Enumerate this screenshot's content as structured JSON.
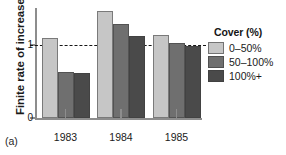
{
  "panel_label": "(a)",
  "axes": {
    "ylabel": "Finite rate of increase",
    "yticks": [
      {
        "value": 0,
        "label": "0"
      },
      {
        "value": 1,
        "label": "1"
      }
    ],
    "xticks": [
      "1983",
      "1984",
      "1985"
    ]
  },
  "legend": {
    "title": "Cover (%)",
    "entries": [
      {
        "label": "0–50%",
        "color": "#c6c6c6"
      },
      {
        "label": "50–100%",
        "color": "#6f6f6f"
      },
      {
        "label": "100%+",
        "color": "#4a4a4a"
      }
    ]
  },
  "chart_data": {
    "type": "bar",
    "title": "",
    "xlabel": "",
    "ylabel": "Finite rate of increase",
    "categories": [
      "1983",
      "1984",
      "1985"
    ],
    "series": [
      {
        "name": "0–50%",
        "color": "#c6c6c6",
        "values": [
          1.1,
          1.47,
          1.14
        ]
      },
      {
        "name": "50–100%",
        "color": "#6f6f6f",
        "values": [
          0.63,
          1.29,
          1.03
        ]
      },
      {
        "name": "100%+",
        "color": "#4a4a4a",
        "values": [
          0.62,
          1.12,
          0.99
        ]
      }
    ],
    "ylim": [
      0,
      1.52
    ],
    "ytick_values": [
      0,
      1
    ],
    "grid": false,
    "legend_position": "right",
    "annotations": [
      {
        "type": "hline",
        "value": 1,
        "style": "dashed",
        "color": "#151515"
      }
    ]
  }
}
